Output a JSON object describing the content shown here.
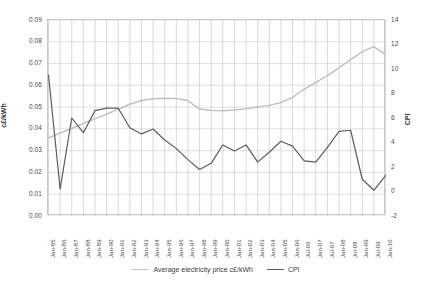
{
  "chart_data": {
    "type": "line",
    "title": "",
    "xlabel": "",
    "ylabel": "c£/kWh",
    "y2label": "CPI",
    "grid": true,
    "legend_position": "bottom",
    "ylim": [
      0.0,
      0.09
    ],
    "y2lim": [
      -2,
      14
    ],
    "yticks": [
      "0.00",
      "0.01",
      "0.02",
      "0.03",
      "0.04",
      "0.05",
      "0.06",
      "0.07",
      "0.08",
      "0.09"
    ],
    "ytick_values": [
      0.0,
      0.01,
      0.02,
      0.03,
      0.04,
      0.05,
      0.06,
      0.07,
      0.08,
      0.09
    ],
    "y2ticks": [
      "-2",
      "0",
      "2",
      "4",
      "6",
      "8",
      "10",
      "12",
      "14"
    ],
    "y2tick_values": [
      -2,
      0,
      2,
      4,
      6,
      8,
      10,
      12,
      14
    ],
    "categories": [
      "Jan-85",
      "Jan-86",
      "Jan-87",
      "Jan-88",
      "Jan-89",
      "Jan-90",
      "Jan-91",
      "Jan-92",
      "Jan-93",
      "Jan-94",
      "Jan-95",
      "Jan-96",
      "Jan-97",
      "Jan-98",
      "Jan-99",
      "Jan-00",
      "Jan-01",
      "Jan-02",
      "Jan-03",
      "Jan-04",
      "Jan-05",
      "Jan-06",
      "Jul-06",
      "Jan-07",
      "Jul-07",
      "Jan-08",
      "Jul-08",
      "Jan-09",
      "Jul-09",
      "Jan-10"
    ],
    "series": [
      {
        "name": "Average electricity price c£/kWh",
        "axis": "left",
        "color": "#c2c2c2",
        "values": [
          0.0358,
          0.0381,
          0.0402,
          0.0425,
          0.0447,
          0.0468,
          0.049,
          0.0513,
          0.053,
          0.0538,
          0.0541,
          0.054,
          0.053,
          0.0491,
          0.0484,
          0.0483,
          0.0487,
          0.0493,
          0.05,
          0.0508,
          0.0521,
          0.0545,
          0.0582,
          0.0613,
          0.0645,
          0.068,
          0.0718,
          0.0755,
          0.0778,
          0.0741
        ]
      },
      {
        "name": "CPI",
        "axis": "right",
        "color": "#5c5c5c",
        "values": [
          9.5,
          0.2,
          6.0,
          4.8,
          6.6,
          6.8,
          6.8,
          5.2,
          4.7,
          5.1,
          4.2,
          3.5,
          2.6,
          1.8,
          2.3,
          3.8,
          3.3,
          3.8,
          2.4,
          3.2,
          4.1,
          3.7,
          2.5,
          2.4,
          3.6,
          4.9,
          5.0,
          1.0,
          0.1,
          1.3
        ]
      }
    ]
  },
  "legend": {
    "items": [
      {
        "label": "Average electricity price c£/kWh",
        "color": "#c2c2c2"
      },
      {
        "label": "CPI",
        "color": "#5c5c5c"
      }
    ]
  }
}
